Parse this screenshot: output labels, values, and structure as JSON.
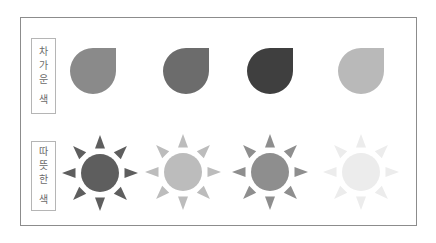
{
  "rows": [
    {
      "label_chars": [
        "차",
        "가",
        "운",
        "색"
      ],
      "label": "차가운 색",
      "shape": "drop-icon",
      "items": [
        {
          "color": "#8a8a8a"
        },
        {
          "color": "#6c6c6c"
        },
        {
          "color": "#3f3f3f"
        },
        {
          "color": "#b9b9b9"
        }
      ]
    },
    {
      "label_chars": [
        "따",
        "뜻",
        "한",
        "색"
      ],
      "label": "따뜻한 색",
      "shape": "sun-icon",
      "items": [
        {
          "color": "#5e5e5e"
        },
        {
          "color": "#bcbcbc"
        },
        {
          "color": "#8e8e8e"
        },
        {
          "color": "#ececec"
        }
      ]
    }
  ]
}
